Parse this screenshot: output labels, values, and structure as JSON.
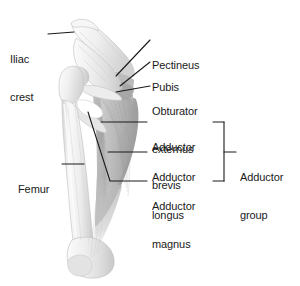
{
  "figure": {
    "view": "anterior view of right hip bone and femur with adductor muscles",
    "background_color": "#ffffff",
    "line_color": "#1a1a1a",
    "text_color": "#1a1a1a",
    "bone_color": "#ececec",
    "bone_light_color": "#f7f7f7",
    "bone_shadow_color": "#c9c9c9",
    "muscle_color": "#b4b4b4",
    "muscle_dark_color": "#9a9a9a",
    "muscle_light_color": "#cfcfcf",
    "foramen_color": "#ffffff"
  },
  "labels": {
    "iliac_crest": {
      "line1": "Iliac",
      "line2": "crest",
      "side": "left"
    },
    "femur": {
      "line1": "Femur",
      "side": "left"
    },
    "pectineus": {
      "line1": "Pectineus",
      "side": "right"
    },
    "pubis": {
      "line1": "Pubis",
      "side": "right"
    },
    "obturator_externus": {
      "line1": "Obturator",
      "line2": "externus",
      "side": "right"
    },
    "adductor_brevis": {
      "line1": "Adductor",
      "line2": "brevis",
      "side": "right"
    },
    "adductor_longus": {
      "line1": "Adductor",
      "line2": "longus",
      "side": "right"
    },
    "adductor_magnus": {
      "line1": "Adductor",
      "line2": "magnus",
      "side": "right"
    },
    "adductor_group": {
      "line1": "Adductor",
      "line2": "group",
      "side": "right",
      "is_bracket_label": true
    }
  },
  "structures": [
    {
      "name": "ilium",
      "kind": "bone"
    },
    {
      "name": "iliac-crest",
      "kind": "bone"
    },
    {
      "name": "acetabulum",
      "kind": "bone"
    },
    {
      "name": "pubis",
      "kind": "bone"
    },
    {
      "name": "ischium",
      "kind": "bone"
    },
    {
      "name": "obturator-foramen",
      "kind": "opening"
    },
    {
      "name": "femur-head",
      "kind": "bone"
    },
    {
      "name": "greater-trochanter",
      "kind": "bone"
    },
    {
      "name": "femur-shaft",
      "kind": "bone"
    },
    {
      "name": "femoral-condyles",
      "kind": "bone"
    },
    {
      "name": "pectineus-muscle",
      "kind": "muscle"
    },
    {
      "name": "obturator-externus-muscle",
      "kind": "muscle"
    },
    {
      "name": "adductor-brevis-muscle",
      "kind": "muscle"
    },
    {
      "name": "adductor-longus-muscle",
      "kind": "muscle"
    },
    {
      "name": "adductor-magnus-muscle",
      "kind": "muscle"
    }
  ]
}
